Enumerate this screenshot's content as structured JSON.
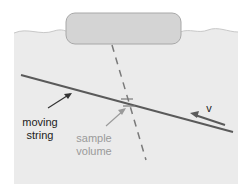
{
  "diagram": {
    "labels": {
      "moving_string": [
        "moving",
        "string"
      ],
      "sample_volume": [
        "sample",
        "volume"
      ],
      "velocity": "v"
    },
    "colors": {
      "water": "#ebebeb",
      "water_edge": "#c8c8c8",
      "probe_fill": "#d4d4d4",
      "probe_stroke": "#a8a8a8",
      "string": "#5a5a5a",
      "dashed_beam": "#7a7a7a",
      "label_dark": "#222222",
      "label_light": "#9a9a9a"
    }
  }
}
